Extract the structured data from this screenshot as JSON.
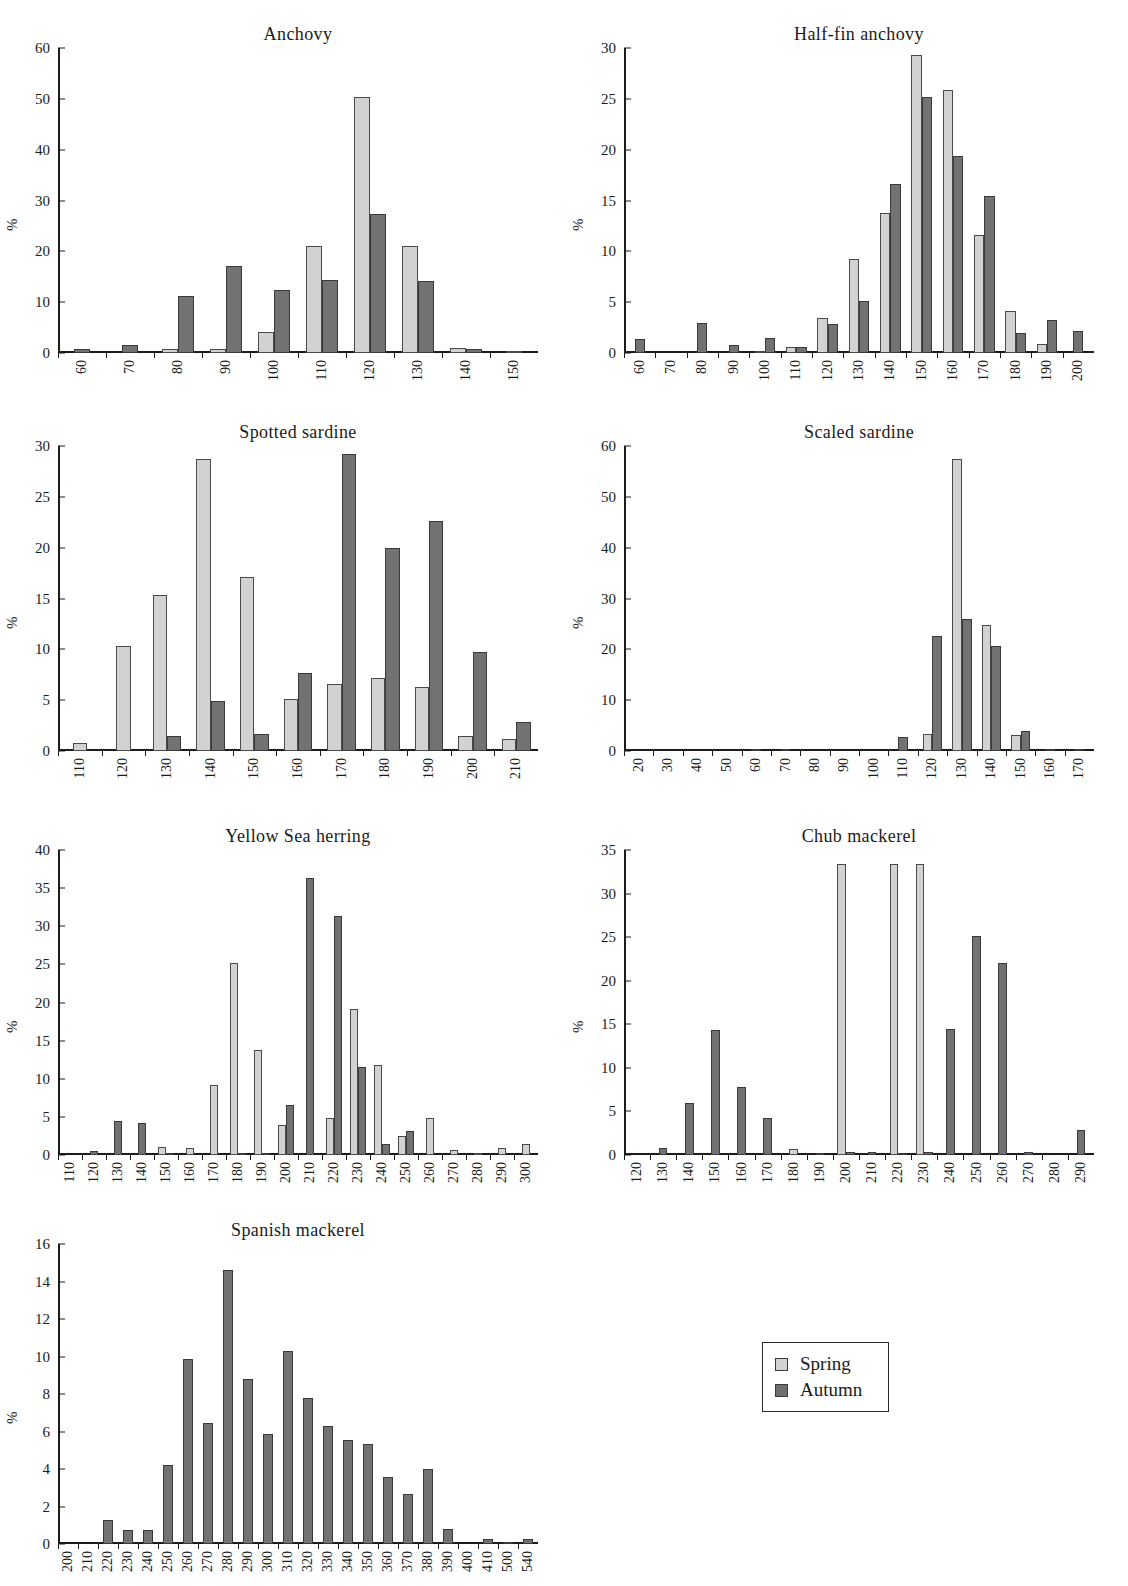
{
  "figure": {
    "ylabel": "%",
    "legend": {
      "spring_label": "Spring",
      "autumn_label": "Autumn",
      "spring_color": "#d2d2d2",
      "autumn_color": "#6e6e6e"
    }
  },
  "chart_data": [
    {
      "type": "bar",
      "title": "Anchovy",
      "xlabel": "",
      "ylabel": "%",
      "ylim": [
        0,
        60
      ],
      "yticks": [
        0,
        10,
        20,
        30,
        40,
        50,
        60
      ],
      "grid": false,
      "categories": [
        "60",
        "70",
        "80",
        "90",
        "100",
        "110",
        "120",
        "130",
        "140",
        "150"
      ],
      "series": [
        {
          "name": "Spring",
          "values": [
            0,
            0,
            0.7,
            0.7,
            4.2,
            21.1,
            50.4,
            21.1,
            1.0,
            0.3
          ]
        },
        {
          "name": "Autumn",
          "values": [
            0.8,
            1.6,
            11.2,
            17.2,
            12.4,
            14.3,
            27.3,
            14.2,
            0.7,
            0
          ]
        }
      ]
    },
    {
      "type": "bar",
      "title": "Half-fin anchovy",
      "xlabel": "",
      "ylabel": "%",
      "ylim": [
        0,
        30
      ],
      "yticks": [
        0,
        5,
        10,
        15,
        20,
        25,
        30
      ],
      "grid": false,
      "categories": [
        "60",
        "70",
        "80",
        "90",
        "100",
        "110",
        "120",
        "130",
        "140",
        "150",
        "160",
        "170",
        "180",
        "190",
        "200"
      ],
      "series": [
        {
          "name": "Spring",
          "values": [
            0,
            0,
            0,
            0,
            0.2,
            0.6,
            3.4,
            9.2,
            13.8,
            29.3,
            25.9,
            11.6,
            4.1,
            0.9,
            0
          ]
        },
        {
          "name": "Autumn",
          "values": [
            1.4,
            0,
            3.0,
            0.8,
            1.5,
            0.6,
            2.9,
            5.1,
            16.6,
            25.2,
            19.4,
            15.4,
            2.0,
            3.2,
            2.2
          ]
        }
      ]
    },
    {
      "type": "bar",
      "title": "Spotted sardine",
      "xlabel": "",
      "ylabel": "%",
      "ylim": [
        0,
        30
      ],
      "yticks": [
        0,
        5,
        10,
        15,
        20,
        25,
        30
      ],
      "grid": false,
      "categories": [
        "110",
        "120",
        "130",
        "140",
        "150",
        "160",
        "170",
        "180",
        "190",
        "200",
        "210"
      ],
      "series": [
        {
          "name": "Spring",
          "values": [
            0.8,
            10.3,
            15.3,
            28.7,
            17.1,
            5.1,
            6.6,
            7.2,
            6.3,
            1.5,
            1.2
          ]
        },
        {
          "name": "Autumn",
          "values": [
            0,
            0,
            1.5,
            4.9,
            1.7,
            7.7,
            29.2,
            20.0,
            22.6,
            9.7,
            2.9
          ]
        }
      ]
    },
    {
      "type": "bar",
      "title": "Scaled sardine",
      "xlabel": "",
      "ylabel": "%",
      "ylim": [
        0,
        60
      ],
      "yticks": [
        0,
        10,
        20,
        30,
        40,
        50,
        60
      ],
      "grid": false,
      "categories": [
        "20",
        "30",
        "40",
        "50",
        "60",
        "70",
        "80",
        "90",
        "100",
        "110",
        "120",
        "130",
        "140",
        "150",
        "160",
        "170"
      ],
      "series": [
        {
          "name": "Spring",
          "values": [
            0,
            0,
            0,
            0,
            0,
            0,
            0,
            0,
            0,
            0,
            3.3,
            57.5,
            24.7,
            3.2,
            0,
            0
          ]
        },
        {
          "name": "Autumn",
          "values": [
            0,
            0,
            0,
            0,
            0.4,
            0.4,
            0,
            0,
            0,
            2.8,
            22.7,
            25.9,
            20.6,
            4.0,
            0.3,
            0.3
          ]
        }
      ]
    },
    {
      "type": "bar",
      "title": "Yellow Sea herring",
      "xlabel": "",
      "ylabel": "%",
      "ylim": [
        0,
        40
      ],
      "yticks": [
        0,
        5,
        10,
        15,
        20,
        25,
        30,
        35,
        40
      ],
      "grid": false,
      "categories": [
        "110",
        "120",
        "130",
        "140",
        "150",
        "160",
        "170",
        "180",
        "190",
        "200",
        "210",
        "220",
        "230",
        "240",
        "250",
        "260",
        "270",
        "280",
        "290",
        "300"
      ],
      "series": [
        {
          "name": "Spring",
          "values": [
            0,
            0,
            0,
            0,
            1.0,
            0.9,
            9.2,
            25.2,
            13.8,
            4.0,
            0,
            4.9,
            19.2,
            11.8,
            2.5,
            4.9,
            0.6,
            0.1,
            0.9,
            1.4
          ]
        },
        {
          "name": "Autumn",
          "values": [
            0,
            0.5,
            4.4,
            4.2,
            0.2,
            0,
            0,
            0.3,
            0.2,
            6.6,
            36.3,
            31.4,
            11.5,
            1.5,
            3.1,
            0,
            0,
            0,
            0,
            0
          ]
        }
      ]
    },
    {
      "type": "bar",
      "title": "Chub mackerel",
      "xlabel": "",
      "ylabel": "%",
      "ylim": [
        0,
        35
      ],
      "yticks": [
        0,
        5,
        10,
        15,
        20,
        25,
        30,
        35
      ],
      "grid": false,
      "categories": [
        "120",
        "130",
        "140",
        "150",
        "160",
        "170",
        "180",
        "190",
        "200",
        "210",
        "220",
        "230",
        "240",
        "250",
        "260",
        "270",
        "280",
        "290"
      ],
      "series": [
        {
          "name": "Spring",
          "values": [
            0,
            0,
            0,
            0,
            0,
            0,
            0.7,
            0,
            33.4,
            0,
            33.4,
            33.4,
            0,
            0,
            0,
            0,
            0,
            0
          ]
        },
        {
          "name": "Autumn",
          "values": [
            0,
            0.8,
            6.0,
            14.3,
            7.8,
            4.2,
            0,
            0.2,
            0.3,
            0.3,
            0.2,
            0.4,
            14.5,
            25.1,
            22.0,
            0.4,
            0,
            2.9
          ]
        }
      ]
    },
    {
      "type": "bar",
      "title": "Spanish mackerel",
      "xlabel": "",
      "ylabel": "%",
      "ylim": [
        0,
        16
      ],
      "yticks": [
        0,
        2,
        4,
        6,
        8,
        10,
        12,
        14,
        16
      ],
      "grid": false,
      "categories": [
        "200",
        "210",
        "220",
        "230",
        "240",
        "250",
        "260",
        "270",
        "280",
        "290",
        "300",
        "310",
        "320",
        "330",
        "340",
        "350",
        "360",
        "370",
        "380",
        "390",
        "400",
        "410",
        "500",
        "540"
      ],
      "series": [
        {
          "name": "Spring",
          "values": [
            0,
            0,
            0,
            0,
            0,
            0,
            0,
            0,
            0,
            0,
            0,
            0,
            0,
            0,
            0,
            0,
            0,
            0,
            0,
            0,
            0,
            0,
            0,
            0
          ]
        },
        {
          "name": "Autumn",
          "values": [
            0,
            0,
            1.3,
            0.75,
            0.75,
            4.2,
            9.85,
            6.45,
            14.6,
            8.8,
            5.85,
            10.3,
            7.8,
            6.3,
            5.55,
            5.35,
            3.6,
            2.65,
            4.0,
            0.8,
            0,
            0.25,
            0.1,
            0.25
          ]
        }
      ]
    }
  ]
}
